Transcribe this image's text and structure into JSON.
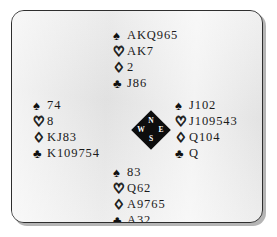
{
  "figure": {
    "kind": "bridge-deal-diagram",
    "background_color": "#ebebeb",
    "border_color": "#2e2e2e",
    "ink_color": "#1b1b1b"
  },
  "suits": {
    "spade": {
      "name": "spade-symbol",
      "glyph": "♠",
      "style": "black"
    },
    "heart": {
      "name": "heart-symbol",
      "glyph": "♡",
      "style": "outline"
    },
    "diamond": {
      "name": "diamond-symbol",
      "glyph": "♢",
      "style": "outline"
    },
    "club": {
      "name": "club-symbol",
      "glyph": "♣",
      "style": "black"
    }
  },
  "compass": {
    "name": "compass-rose",
    "fill_color": "#0d0d0d",
    "label_color": "#ffffff",
    "north": "N",
    "west": "W",
    "east": "E",
    "south": "S"
  },
  "hands": {
    "north": {
      "seat": "North",
      "spades": "AKQ965",
      "hearts": "AK7",
      "diamonds": "2",
      "clubs": "J86"
    },
    "west": {
      "seat": "West",
      "spades": "74",
      "hearts": "8",
      "diamonds": "KJ83",
      "clubs": "K109754"
    },
    "east": {
      "seat": "East",
      "spades": "J102",
      "hearts": "J109543",
      "diamonds": "Q104",
      "clubs": "Q"
    },
    "south": {
      "seat": "South",
      "spades": "83",
      "hearts": "Q62",
      "diamonds": "A9765",
      "clubs": "A32"
    }
  }
}
